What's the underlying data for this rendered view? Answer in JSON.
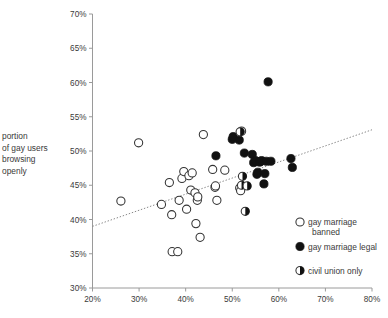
{
  "chart_data": {
    "type": "scatter",
    "title": "",
    "xlabel": "",
    "ylabel": "portion of gay users browsing openly",
    "ylabel_lines": [
      "portion",
      "of gay users",
      "browsing",
      "openly"
    ],
    "xlim": [
      20,
      80
    ],
    "ylim": [
      30,
      70
    ],
    "xticks": [
      20,
      30,
      40,
      50,
      60,
      70,
      80
    ],
    "yticks": [
      30,
      35,
      40,
      45,
      50,
      55,
      60,
      65,
      70
    ],
    "xtick_labels": [
      "20%",
      "30%",
      "40%",
      "50%",
      "60%",
      "70%",
      "80%"
    ],
    "ytick_labels": [
      "30%",
      "35%",
      "40%",
      "45%",
      "50%",
      "55%",
      "60%",
      "65%",
      "70%"
    ],
    "grid": false,
    "legend_position": "bottom-right",
    "colors": {
      "marker_open_stroke": "#333333",
      "marker_open_fill": "#ffffff",
      "marker_filled": "#111111",
      "marker_half_fill": "#111111",
      "axis": "#9a9a9a",
      "trendline": "#888888",
      "text": "#3a3a3a",
      "background": "#ffffff"
    },
    "legend": [
      {
        "key": "open",
        "label": "gay marriage banned",
        "marker": "open-circle"
      },
      {
        "key": "filled",
        "label": "gay marriage legal",
        "marker": "filled-circle"
      },
      {
        "key": "half",
        "label": "civil union only",
        "marker": "half-filled-circle"
      }
    ],
    "trendline": {
      "style": "dotted",
      "x0": 20,
      "y0": 39.0,
      "x1": 80,
      "y1": 53.1
    },
    "series": [
      {
        "name": "gay marriage banned",
        "key": "open",
        "marker": "open-circle",
        "points": [
          [
            26.1,
            42.7
          ],
          [
            29.9,
            51.2
          ],
          [
            34.8,
            42.2
          ],
          [
            36.5,
            45.4
          ],
          [
            37.0,
            40.7
          ],
          [
            37.1,
            35.3
          ],
          [
            38.3,
            35.3
          ],
          [
            38.6,
            42.8
          ],
          [
            39.2,
            46.0
          ],
          [
            39.6,
            47.0
          ],
          [
            40.2,
            41.5
          ],
          [
            40.7,
            46.4
          ],
          [
            41.1,
            44.3
          ],
          [
            41.4,
            46.8
          ],
          [
            42.0,
            43.9
          ],
          [
            42.2,
            39.4
          ],
          [
            42.5,
            42.8
          ],
          [
            42.6,
            43.3
          ],
          [
            43.1,
            37.4
          ],
          [
            43.8,
            52.4
          ],
          [
            45.8,
            47.3
          ],
          [
            46.3,
            44.7
          ],
          [
            46.4,
            44.9
          ],
          [
            46.7,
            42.8
          ],
          [
            48.4,
            47.2
          ],
          [
            51.6,
            44.6
          ],
          [
            51.8,
            44.2
          ],
          [
            52.0,
            52.9
          ]
        ]
      },
      {
        "name": "gay marriage legal",
        "key": "filled",
        "marker": "filled-circle",
        "points": [
          [
            46.5,
            49.3
          ],
          [
            50.0,
            51.7
          ],
          [
            50.2,
            52.1
          ],
          [
            51.5,
            51.6
          ],
          [
            52.6,
            49.7
          ],
          [
            54.3,
            49.5
          ],
          [
            54.6,
            48.3
          ],
          [
            55.0,
            48.6
          ],
          [
            55.3,
            46.6
          ],
          [
            55.5,
            46.9
          ],
          [
            55.8,
            48.4
          ],
          [
            56.0,
            48.4
          ],
          [
            56.3,
            48.6
          ],
          [
            56.8,
            45.2
          ],
          [
            57.0,
            46.7
          ],
          [
            57.3,
            48.5
          ],
          [
            57.7,
            60.1
          ],
          [
            58.3,
            48.5
          ],
          [
            62.6,
            48.9
          ],
          [
            62.9,
            47.6
          ]
        ]
      },
      {
        "name": "civil union only",
        "key": "half",
        "marker": "half-filled-circle",
        "points": [
          [
            51.7,
            52.8
          ],
          [
            52.0,
            45.0
          ],
          [
            52.2,
            46.3
          ],
          [
            52.8,
            41.2
          ],
          [
            53.2,
            44.9
          ]
        ]
      }
    ]
  }
}
